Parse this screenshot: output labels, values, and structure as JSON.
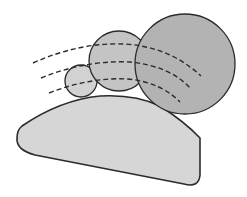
{
  "diagram": {
    "colors": {
      "background": "#ffffff",
      "base_fill": "#d6d6d6",
      "small_circle_fill": "#d2d2d2",
      "medium_circle_fill": "#c4c4c4",
      "large_circle_fill": "#b3b3b3",
      "stroke": "#2b2b2b"
    },
    "shapes": {
      "small_circle": {
        "cx": 81,
        "cy": 81,
        "r": 16
      },
      "medium_circle": {
        "cx": 119,
        "cy": 61,
        "r": 30
      },
      "large_circle": {
        "cx": 185,
        "cy": 64,
        "r": 50
      }
    }
  }
}
